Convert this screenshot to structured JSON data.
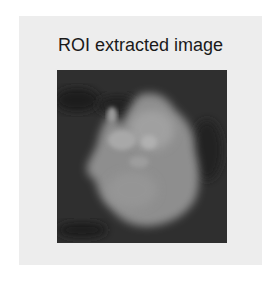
{
  "figure": {
    "title": "ROI extracted image",
    "image": {
      "description": "grayscale ROI crop showing bright blob on dark background",
      "background_color": "#2e2e2e",
      "blob_color": "#9a9a9a"
    }
  }
}
